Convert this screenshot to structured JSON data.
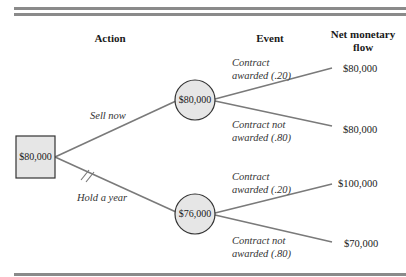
{
  "headers": {
    "action": "Action",
    "event": "Event",
    "net_flow_line1": "Net monetary",
    "net_flow_line2": "flow"
  },
  "decision_node": {
    "value": "$80,000"
  },
  "actions": [
    {
      "label": "Sell now",
      "chance_node_value": "$80,000"
    },
    {
      "label": "Hold a year",
      "chance_node_value": "$76,000",
      "pruned": true
    }
  ],
  "events": [
    {
      "line1": "Contract",
      "line2": "awarded (.20)",
      "outcome": "$80,000"
    },
    {
      "line1": "Contract not",
      "line2": "awarded (.80)",
      "outcome": "$80,000"
    },
    {
      "line1": "Contract",
      "line2": "awarded (.20)",
      "outcome": "$100,000"
    },
    {
      "line1": "Contract not",
      "line2": "awarded (.80)",
      "outcome": "$70,000"
    }
  ],
  "colors": {
    "line": "#7a7a7a",
    "node_fill": "#e6e6e6",
    "node_stroke": "#333333",
    "rule": "#8a8a8a"
  }
}
